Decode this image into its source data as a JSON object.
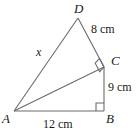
{
  "figure": {
    "kind": "geometry-diagram",
    "background_color": "#ffffff",
    "stroke_color": "#6b6b6b",
    "text_color": "#1a1a1a",
    "vertices": [
      {
        "name": "A",
        "label": "A",
        "x": 14,
        "y": 111
      },
      {
        "name": "B",
        "label": "B",
        "x": 104,
        "y": 111
      },
      {
        "name": "C",
        "label": "C",
        "x": 104,
        "y": 67
      },
      {
        "name": "D",
        "label": "D",
        "x": 78,
        "y": 18
      }
    ],
    "segments": [
      {
        "name": "AB",
        "from": "A",
        "to": "B",
        "label": "12 cm"
      },
      {
        "name": "BC",
        "from": "B",
        "to": "C",
        "label": "9 cm"
      },
      {
        "name": "AC",
        "from": "A",
        "to": "C",
        "label": ""
      },
      {
        "name": "CD",
        "from": "C",
        "to": "D",
        "label": "8 cm"
      },
      {
        "name": "AD",
        "from": "A",
        "to": "D",
        "label": "x"
      }
    ],
    "right_angles": [
      {
        "name": "right-angle-at-B",
        "at": "B"
      },
      {
        "name": "right-angle-at-C",
        "at": "C"
      }
    ],
    "labels": {
      "vertex_a": "A",
      "vertex_b": "B",
      "vertex_c": "C",
      "vertex_d": "D",
      "side_ab": "12 cm",
      "side_bc": "9 cm",
      "side_cd": "8 cm",
      "side_ad": "x"
    }
  }
}
